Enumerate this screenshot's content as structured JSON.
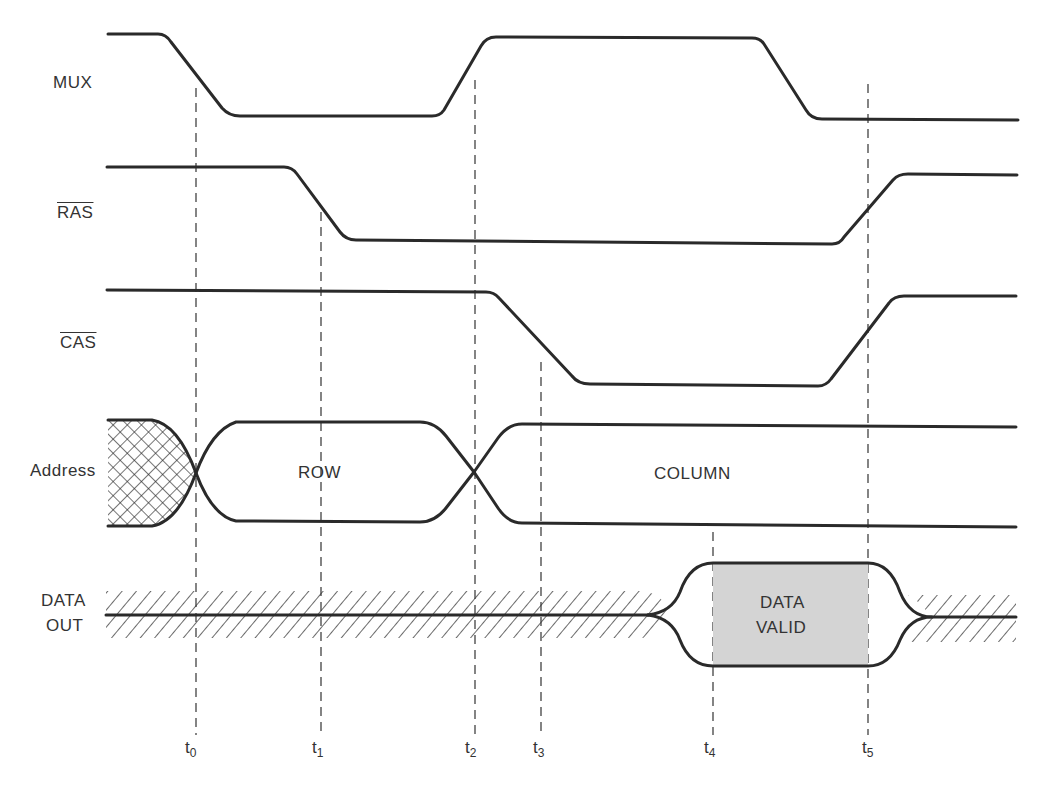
{
  "diagram": {
    "type": "timing-diagram",
    "signals": [
      {
        "id": "mux",
        "label": "MUX",
        "active_low": false
      },
      {
        "id": "ras",
        "label": "RAS",
        "active_low": true
      },
      {
        "id": "cas",
        "label": "CAS",
        "active_low": true
      },
      {
        "id": "address",
        "label": "Address",
        "active_low": false
      },
      {
        "id": "data_out",
        "label_line1": "DATA",
        "label_line2": "OUT",
        "active_low": false
      }
    ],
    "bus_labels": {
      "row": "ROW",
      "column": "COLUMN",
      "data_valid_line1": "DATA",
      "data_valid_line2": "VALID"
    },
    "time_markers": [
      {
        "base": "t",
        "sub": "0"
      },
      {
        "base": "t",
        "sub": "1"
      },
      {
        "base": "t",
        "sub": "2"
      },
      {
        "base": "t",
        "sub": "3"
      },
      {
        "base": "t",
        "sub": "4"
      },
      {
        "base": "t",
        "sub": "5"
      }
    ],
    "colors": {
      "line": "#2a2a2a",
      "data_valid_fill": "#d4d4d4",
      "background": "#ffffff"
    }
  }
}
